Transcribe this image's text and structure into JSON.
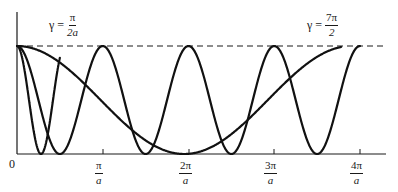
{
  "chart_data": {
    "type": "line",
    "title": "",
    "xlabel": "",
    "ylabel": "",
    "x_origin_label": "0",
    "x_ticks": [
      {
        "num": "π",
        "den": "a",
        "value_over_pi_a": 1
      },
      {
        "num": "2π",
        "den": "a",
        "value_over_pi_a": 2
      },
      {
        "num": "3π",
        "den": "a",
        "value_over_pi_a": 3
      },
      {
        "num": "4π",
        "den": "a",
        "value_over_pi_a": 4
      }
    ],
    "xlim_over_pi_a": [
      0,
      4.3
    ],
    "ylim": [
      0,
      1
    ],
    "reference_line": {
      "y": 1,
      "style": "dashed"
    },
    "annotations": [
      {
        "text_lhs": "γ",
        "eq": "=",
        "num": "π",
        "den": "2a",
        "points_to": "slow curve (γ = π/2a)"
      },
      {
        "text_lhs": "γ",
        "eq": "=",
        "num": "7π",
        "den": "2",
        "points_to": "fast curve (γ = 7π/2)"
      }
    ],
    "series": [
      {
        "name": "γ = π/2a (slow)",
        "form": "cos²(γx)",
        "gamma_times_a_over_pi": 0.5,
        "note": "single broad dip reaching zero near x = 2π/a, back to 1 near x ≈ 3.7π/a"
      },
      {
        "name": "intermediate",
        "form": "cos²(γx)",
        "gamma_times_a_over_pi": 3.5,
        "note": "first zero near x ≈ 0.25π/a ... oscillating"
      },
      {
        "name": "γ = 7π/2 (fast)",
        "form": "|cos(γ x)|-like",
        "gamma_times_a_over_pi": 1.75,
        "note": "peaks at x = π/a·(0, 0.57, 1.14, 2.0, 3.0, 4.0); zeros at ~0.28, 0.5, 1.5, 2.5, 3.5"
      }
    ],
    "grid": false,
    "legend": "none (inline annotations)"
  },
  "axes": {
    "origin_label": "0"
  }
}
